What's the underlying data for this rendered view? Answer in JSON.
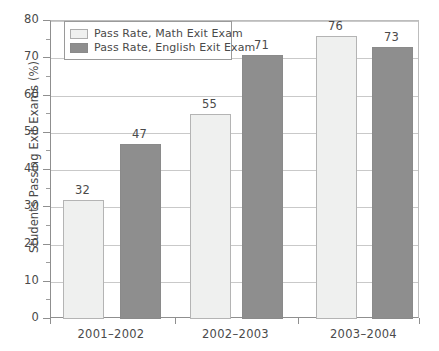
{
  "chart_data": {
    "type": "bar",
    "title": "",
    "xlabel": "",
    "ylabel": "Students Passing Exit Exams (%)",
    "categories": [
      "2001–2002",
      "2002–2003",
      "2003–2004"
    ],
    "series": [
      {
        "name": "Pass Rate, Math Exit Exam",
        "color": "#eff0ef",
        "values": [
          32,
          55,
          76
        ]
      },
      {
        "name": "Pass Rate, English Exit Exam",
        "color": "#8e8e8e",
        "values": [
          47,
          71,
          73
        ]
      }
    ],
    "ylim": [
      0,
      80
    ],
    "ytick_values": [
      0,
      10,
      20,
      30,
      40,
      50,
      60,
      70,
      80
    ],
    "ytick_labels": [
      "0",
      "10",
      "20",
      "30",
      "40",
      "50",
      "60",
      "70",
      "80"
    ],
    "yminor_values": [
      5,
      15,
      25,
      35,
      45,
      55,
      65,
      75
    ],
    "grid": true,
    "grid_axis": "y",
    "legend_position": "top-left",
    "data_labels": true,
    "bar_value_labels": [
      "32",
      "47",
      "55",
      "71",
      "76",
      "73"
    ]
  },
  "legend": {
    "items": [
      {
        "label": "Pass Rate, Math Exit Exam",
        "swatch": "light"
      },
      {
        "label": "Pass Rate, English Exit Exam",
        "swatch": "dark"
      }
    ]
  },
  "axes": {
    "y_axis_label": "Students Passing Exit Exams (%)"
  },
  "colors": {
    "series_math": "#eff0ef",
    "series_english": "#8e8e8e",
    "grid": "#c9c9c9",
    "axis": "#8f8f8f",
    "text": "#4a4a4a",
    "background": "#ffffff"
  }
}
